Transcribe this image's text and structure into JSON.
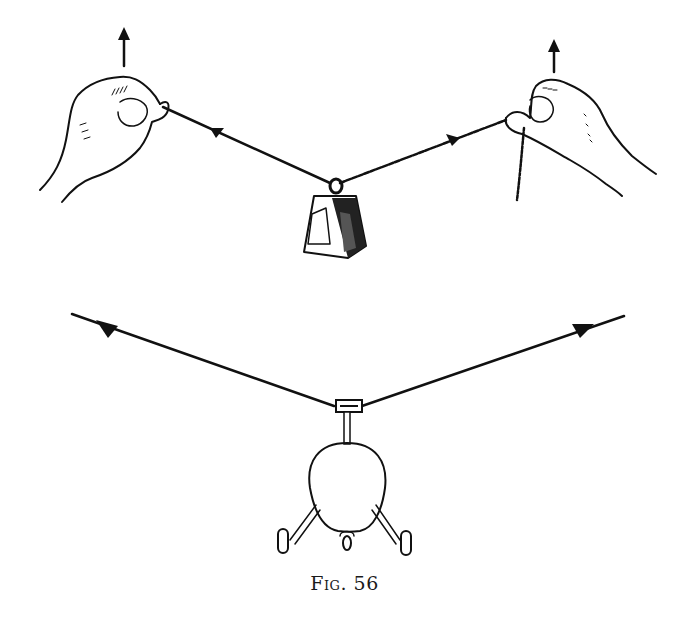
{
  "figure": {
    "caption_prefix": "Fig.",
    "caption_number": "56",
    "colors": {
      "ink": "#111111",
      "paper": "#ffffff"
    },
    "top_scene": {
      "description": "Two hands pulling a string upward at both ends with a weight hanging in the middle",
      "left_hand_arrow": "up-arrow",
      "right_hand_arrow": "up-arrow",
      "string_arrows": [
        "left-arrow",
        "right-arrow"
      ],
      "weight": "bell-weight"
    },
    "bottom_scene": {
      "description": "Helicopter suspended from a cable pulled outward at both ends",
      "cable_arrows": [
        "left-arrow",
        "right-arrow"
      ],
      "object": "helicopter-front-view"
    }
  }
}
